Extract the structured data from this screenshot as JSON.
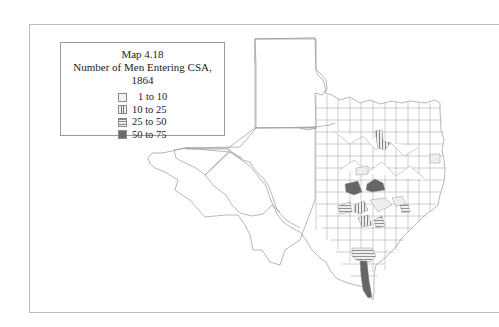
{
  "map": {
    "title": "Map 4.18",
    "subtitle": "Number of Men Entering CSA, 1864",
    "region": "Texas counties",
    "legend": [
      {
        "label": "1 to 10",
        "pattern": "light",
        "color": "#f2f2f2"
      },
      {
        "label": "10 to 25",
        "pattern": "vertical-hatch",
        "color": "#777777"
      },
      {
        "label": "25 to 50",
        "pattern": "horizontal-hatch",
        "color": "#888888"
      },
      {
        "label": "50 to 75",
        "pattern": "dark",
        "color": "#6a6a6a"
      }
    ],
    "outline_color": "#9a9a9a",
    "frame_color": "#bdbdbd"
  }
}
